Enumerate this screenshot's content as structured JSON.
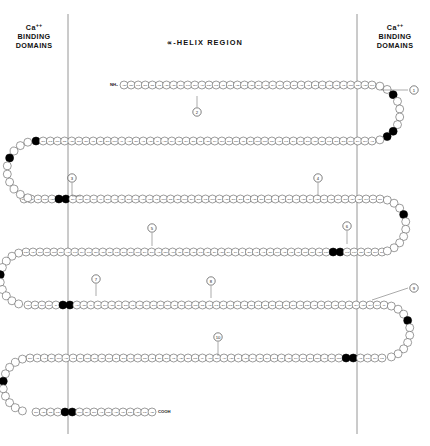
{
  "figure": {
    "type": "protein-sequence-diagram",
    "title_center": "-HELIX REGION",
    "alpha_glyph": "∝",
    "header_left": {
      "line1": "Ca",
      "sup": "++",
      "line2": "BINDING",
      "line3": "DOMAINS"
    },
    "header_right": {
      "line1": "Ca",
      "sup": "++",
      "line2": "BINDING",
      "line3": "DOMAINS"
    },
    "n_terminus": "NH₂",
    "c_terminus": "COOH",
    "divider_left_x": 68,
    "divider_right_x": 357,
    "colors": {
      "ink": "#1a1a1a",
      "residue_fill": "#ffffff",
      "residue_stroke": "#4a4a4a",
      "binding_fill": "#000000",
      "divider": "#8a8a8a",
      "leader": "#555555"
    },
    "callouts": [
      {
        "id": "1",
        "cx": 414,
        "cy": 90,
        "tx": 381,
        "ty": 90,
        "dir": "left"
      },
      {
        "id": "2",
        "cx": 197,
        "cy": 112,
        "tx": 197,
        "ty": 96,
        "dir": "up"
      },
      {
        "id": "3",
        "cx": 72,
        "cy": 178,
        "tx": 72,
        "ty": 196,
        "dir": "down-right"
      },
      {
        "id": "4",
        "cx": 318,
        "cy": 178,
        "tx": 318,
        "ty": 196,
        "dir": "down"
      },
      {
        "id": "5",
        "cx": 152,
        "cy": 228,
        "tx": 152,
        "ty": 246,
        "dir": "down"
      },
      {
        "id": "6",
        "cx": 347,
        "cy": 226,
        "tx": 347,
        "ty": 244,
        "dir": "down"
      },
      {
        "id": "7",
        "cx": 96,
        "cy": 279,
        "tx": 96,
        "ty": 296,
        "dir": "down"
      },
      {
        "id": "8",
        "cx": 211,
        "cy": 281,
        "tx": 211,
        "ty": 298,
        "dir": "down"
      },
      {
        "id": "9",
        "cx": 414,
        "cy": 288,
        "tx": 372,
        "ty": 300,
        "dir": "left"
      },
      {
        "id": "10",
        "cx": 218,
        "cy": 337,
        "tx": 218,
        "ty": 356,
        "dir": "down"
      }
    ],
    "rows": [
      {
        "index": 0,
        "y": 85,
        "x_start": 124,
        "x_end": 372,
        "count": 36,
        "binding_indices": [],
        "labels": [
          "Asp",
          "Thr",
          "Lys",
          "Glu",
          "Thr",
          "Val",
          "Asp",
          "Asp",
          "Glu",
          "Lys",
          "Glu",
          "Ala",
          "Phe",
          "Lys",
          "Val",
          "Phe",
          "Asp",
          "Lys",
          "Asp",
          "Gly",
          "Asn",
          "Gly",
          "Tyr",
          "Ile",
          "Ser",
          "Ala",
          "Ala",
          "Glu",
          "Leu",
          "Arg",
          "His",
          "Val",
          "Met",
          "Thr",
          "Asn",
          "Leu"
        ]
      },
      {
        "index": 1,
        "y": 141,
        "x_start": 36,
        "x_end": 372,
        "count": 48,
        "binding_indices": [
          0
        ],
        "labels": [
          "Gly",
          "Glu",
          "Lys",
          "Leu",
          "Thr",
          "Asp",
          "Glu",
          "Glu",
          "Val",
          "Asp",
          "Glu",
          "Met",
          "Ile",
          "Arg",
          "Glu",
          "Ala",
          "Asp",
          "Ile",
          "Asp",
          "Gly",
          "Asp",
          "Gly",
          "Gln",
          "Val",
          "Asn",
          "Tyr",
          "Glu",
          "Glu",
          "Phe",
          "Val",
          "Gln",
          "Met",
          "Met",
          "Thr",
          "Ala",
          "Lys",
          "Gly",
          "Lys",
          "Glu",
          "Asp",
          "Thr",
          "Lys",
          "Glu",
          "Gln",
          "Leu",
          "Gly",
          "Glu",
          "Ala"
        ]
      },
      {
        "index": 2,
        "y": 199,
        "x_start": 24,
        "x_end": 380,
        "count": 52,
        "binding_indices": [
          5,
          6
        ],
        "labels": [
          "Phe",
          "Arg",
          "Val",
          "Phe",
          "Asp",
          "Lys",
          "Asp",
          "Gly",
          "Asn",
          "Gly",
          "Tyr",
          "Ile",
          "Ser",
          "Ala",
          "Ala",
          "Glu",
          "Leu",
          "Arg",
          "His",
          "Val",
          "Met",
          "Thr",
          "Asn",
          "Leu",
          "Gly",
          "Glu",
          "Lys",
          "Leu",
          "Thr",
          "Asp",
          "Glu",
          "Glu",
          "Val",
          "Asp",
          "Glu",
          "Met",
          "Ile",
          "Arg",
          "Glu",
          "Ala",
          "Asp",
          "Ile",
          "Asp",
          "Gly",
          "Asp",
          "Gly",
          "Gln",
          "Val",
          "Asn",
          "Tyr",
          "Glu",
          "Glu"
        ]
      },
      {
        "index": 3,
        "y": 252,
        "x_start": 26,
        "x_end": 382,
        "count": 52,
        "binding_indices": [
          44,
          45
        ],
        "labels": [
          "Phe",
          "Val",
          "Gln",
          "Met",
          "Met",
          "Thr",
          "Ala",
          "Lys",
          "Gly",
          "Lys",
          "Glu",
          "Asp",
          "Thr",
          "Lys",
          "Glu",
          "Gln",
          "Leu",
          "Gly",
          "Glu",
          "Ala",
          "Phe",
          "Arg",
          "Val",
          "Phe",
          "Asp",
          "Lys",
          "Asp",
          "Gly",
          "Asn",
          "Gly",
          "Tyr",
          "Ile",
          "Ser",
          "Ala",
          "Ala",
          "Glu",
          "Leu",
          "Arg",
          "His",
          "Val",
          "Met",
          "Thr",
          "Asn",
          "Leu",
          "Gly",
          "Glu",
          "Lys",
          "Leu",
          "Thr",
          "Asp",
          "Glu",
          "Glu"
        ]
      },
      {
        "index": 4,
        "y": 305,
        "x_start": 28,
        "x_end": 384,
        "count": 52,
        "binding_indices": [
          5,
          6
        ],
        "labels": [
          "Val",
          "Asp",
          "Glu",
          "Met",
          "Ile",
          "Arg",
          "Glu",
          "Ala",
          "Asp",
          "Ile",
          "Asp",
          "Gly",
          "Asp",
          "Gly",
          "Gln",
          "Val",
          "Asn",
          "Tyr",
          "Glu",
          "Glu",
          "Phe",
          "Val",
          "Gln",
          "Met",
          "Met",
          "Thr",
          "Ala",
          "Lys",
          "Gly",
          "Lys",
          "Glu",
          "Asp",
          "Thr",
          "Lys",
          "Glu",
          "Gln",
          "Leu",
          "Gly",
          "Glu",
          "Ala",
          "Phe",
          "Arg",
          "Val",
          "Phe",
          "Asp",
          "Lys",
          "Asp",
          "Gly",
          "Asn",
          "Gly",
          "Tyr",
          "Ile"
        ]
      },
      {
        "index": 5,
        "y": 358,
        "x_start": 30,
        "x_end": 382,
        "count": 50,
        "binding_indices": [
          44,
          45
        ],
        "labels": [
          "Ser",
          "Ala",
          "Ala",
          "Glu",
          "Leu",
          "Arg",
          "His",
          "Val",
          "Met",
          "Thr",
          "Asn",
          "Leu",
          "Gly",
          "Glu",
          "Lys",
          "Leu",
          "Thr",
          "Asp",
          "Glu",
          "Glu",
          "Val",
          "Asp",
          "Glu",
          "Met",
          "Ile",
          "Arg",
          "Glu",
          "Ala",
          "Asp",
          "Ile",
          "Asp",
          "Gly",
          "Asp",
          "Gly",
          "Gln",
          "Val",
          "Asn",
          "Tyr",
          "Glu",
          "Glu",
          "Phe",
          "Val",
          "Gln",
          "Met",
          "Met",
          "Thr",
          "Ala",
          "Lys",
          "Gly",
          "Lys"
        ]
      },
      {
        "index": 6,
        "y": 412,
        "x_start": 36,
        "x_end": 152,
        "count": 17,
        "binding_indices": [
          4,
          5
        ],
        "labels": [
          "Glu",
          "Asp",
          "Thr",
          "Lys",
          "Glu",
          "Gln",
          "Leu",
          "Gly",
          "Glu",
          "Ala",
          "Phe",
          "Arg",
          "Val",
          "Phe",
          "Asp",
          "Lys",
          "Asp"
        ]
      }
    ],
    "turns": [
      {
        "side": "right",
        "cx": 372,
        "cy": 113,
        "r": 28,
        "from_row": 0,
        "to_row": 1,
        "binding_indices": [
          3,
          8,
          9
        ]
      },
      {
        "side": "left",
        "cx": 36,
        "cy": 170,
        "r": 29,
        "from_row": 1,
        "to_row": 2,
        "binding_indices": [
          4
        ]
      },
      {
        "side": "right",
        "cx": 380,
        "cy": 225,
        "r": 26,
        "from_row": 2,
        "to_row": 3,
        "binding_indices": [
          4
        ]
      },
      {
        "side": "left",
        "cx": 26,
        "cy": 278,
        "r": 26,
        "from_row": 3,
        "to_row": 4,
        "binding_indices": [
          5
        ]
      },
      {
        "side": "right",
        "cx": 384,
        "cy": 331,
        "r": 26,
        "from_row": 4,
        "to_row": 5,
        "binding_indices": [
          4
        ]
      },
      {
        "side": "left",
        "cx": 30,
        "cy": 385,
        "r": 27,
        "from_row": 5,
        "to_row": 6,
        "binding_indices": [
          5
        ]
      }
    ]
  }
}
